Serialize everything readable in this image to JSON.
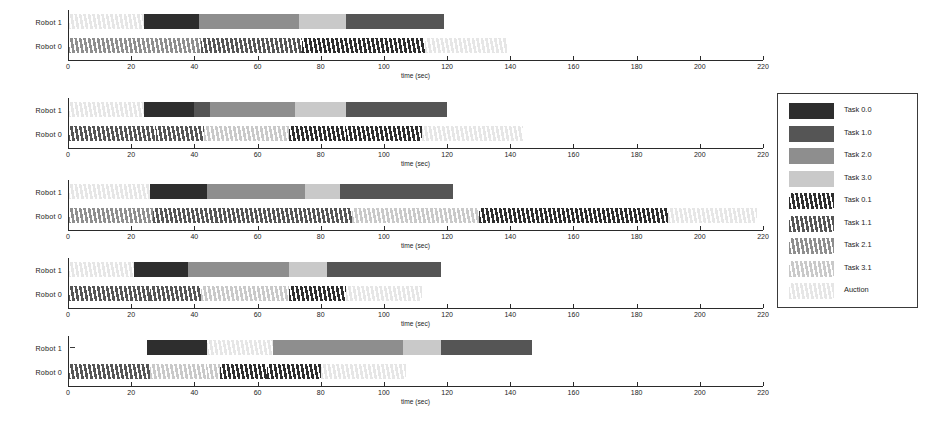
{
  "figure": {
    "axis_title": "time (sec)",
    "xlim": [
      0,
      220
    ],
    "xticks": [
      0,
      20,
      40,
      60,
      80,
      100,
      120,
      140,
      160,
      180,
      200,
      220
    ],
    "row_labels": [
      "Robot 1",
      "Robot 0"
    ]
  },
  "colors": {
    "task_0_0": "#2e2e2e",
    "task_1_0": "#555555",
    "task_2_0": "#8e8e8e",
    "task_3_0": "#c9c9c9",
    "task_0_1": "#2e2e2e",
    "task_1_1": "#555555",
    "task_2_1": "#8e8e8e",
    "task_3_1": "#c9c9c9",
    "auction": "#e6e6e6",
    "axis": "#2a2a2a",
    "text": "#232323",
    "background": "#ffffff"
  },
  "legend": {
    "items": [
      {
        "label": "Task 0.0",
        "key": "task_0_0",
        "hatched": false
      },
      {
        "label": "Task 1.0",
        "key": "task_1_0",
        "hatched": false
      },
      {
        "label": "Task 2.0",
        "key": "task_2_0",
        "hatched": false
      },
      {
        "label": "Task 3.0",
        "key": "task_3_0",
        "hatched": false
      },
      {
        "label": "Task 0.1",
        "key": "task_0_1",
        "hatched": true
      },
      {
        "label": "Task 1.1",
        "key": "task_1_1",
        "hatched": true
      },
      {
        "label": "Task 2.1",
        "key": "task_2_1",
        "hatched": true
      },
      {
        "label": "Task 3.1",
        "key": "task_3_1",
        "hatched": true
      },
      {
        "label": "Auction",
        "key": "auction",
        "hatched": true
      }
    ]
  },
  "chart_data": {
    "type": "bar",
    "title": "",
    "xlabel": "time (sec)",
    "ylabel": "",
    "xlim": [
      0,
      220
    ],
    "grid": false,
    "legend_position": "right",
    "subplots": [
      {
        "index": 1,
        "rows": [
          {
            "name": "Robot 1",
            "segments": [
              {
                "task": "Auction",
                "start": 0,
                "end": 24
              },
              {
                "task": "Task 0.0",
                "start": 24,
                "end": 41.5
              },
              {
                "task": "Task 2.0",
                "start": 41.5,
                "end": 73
              },
              {
                "task": "Task 3.0",
                "start": 73,
                "end": 88
              },
              {
                "task": "Task 1.0",
                "start": 88,
                "end": 113
              },
              {
                "task": "Task 1.0",
                "start": 113,
                "end": 119
              }
            ]
          },
          {
            "name": "Robot 0",
            "segments": [
              {
                "task": "Task 2.1",
                "start": 0,
                "end": 42
              },
              {
                "task": "Task 1.1",
                "start": 42,
                "end": 74
              },
              {
                "task": "Task 0.1",
                "start": 74,
                "end": 113
              },
              {
                "task": "Auction",
                "start": 113,
                "end": 139
              }
            ]
          }
        ]
      },
      {
        "index": 2,
        "rows": [
          {
            "name": "Robot 1",
            "segments": [
              {
                "task": "Auction",
                "start": 0,
                "end": 24
              },
              {
                "task": "Task 0.0",
                "start": 24,
                "end": 40
              },
              {
                "task": "Task 1.0",
                "start": 40,
                "end": 45
              },
              {
                "task": "Task 2.0",
                "start": 45,
                "end": 72
              },
              {
                "task": "Task 3.0",
                "start": 72,
                "end": 88
              },
              {
                "task": "Task 1.0",
                "start": 88,
                "end": 111
              },
              {
                "task": "Task 1.0",
                "start": 111,
                "end": 120
              }
            ]
          },
          {
            "name": "Robot 0",
            "segments": [
              {
                "task": "Task 1.1",
                "start": 0,
                "end": 28
              },
              {
                "task": "Task 1.1",
                "start": 28,
                "end": 43
              },
              {
                "task": "Task 3.1",
                "start": 43,
                "end": 70
              },
              {
                "task": "Task 0.1",
                "start": 70,
                "end": 88
              },
              {
                "task": "Task 0.1",
                "start": 88,
                "end": 112
              },
              {
                "task": "Auction",
                "start": 112,
                "end": 144
              }
            ]
          }
        ]
      },
      {
        "index": 3,
        "rows": [
          {
            "name": "Robot 1",
            "segments": [
              {
                "task": "Auction",
                "start": 0,
                "end": 26
              },
              {
                "task": "Task 0.0",
                "start": 26,
                "end": 44
              },
              {
                "task": "Task 2.0",
                "start": 44,
                "end": 75
              },
              {
                "task": "Task 3.0",
                "start": 75,
                "end": 86
              },
              {
                "task": "Task 1.0",
                "start": 86,
                "end": 122
              }
            ]
          },
          {
            "name": "Robot 0",
            "segments": [
              {
                "task": "Task 2.1",
                "start": 0,
                "end": 27
              },
              {
                "task": "Task 1.1",
                "start": 27,
                "end": 47
              },
              {
                "task": "Task 1.1",
                "start": 47,
                "end": 90
              },
              {
                "task": "Task 3.1",
                "start": 90,
                "end": 130
              },
              {
                "task": "Task 0.1",
                "start": 130,
                "end": 190
              },
              {
                "task": "Auction",
                "start": 190,
                "end": 218
              }
            ]
          }
        ]
      },
      {
        "index": 4,
        "rows": [
          {
            "name": "Robot 1",
            "segments": [
              {
                "task": "Auction",
                "start": 0,
                "end": 21
              },
              {
                "task": "Task 0.0",
                "start": 21,
                "end": 38
              },
              {
                "task": "Task 2.0",
                "start": 38,
                "end": 70
              },
              {
                "task": "Task 3.0",
                "start": 70,
                "end": 82
              },
              {
                "task": "Task 1.0",
                "start": 82,
                "end": 88
              },
              {
                "task": "Task 1.0",
                "start": 88,
                "end": 118
              }
            ]
          },
          {
            "name": "Robot 0",
            "segments": [
              {
                "task": "Task 1.1",
                "start": 0,
                "end": 26
              },
              {
                "task": "Task 1.1",
                "start": 26,
                "end": 42
              },
              {
                "task": "Task 3.1",
                "start": 42,
                "end": 70
              },
              {
                "task": "Task 0.1",
                "start": 70,
                "end": 88
              },
              {
                "task": "Auction",
                "start": 88,
                "end": 112
              }
            ]
          }
        ]
      },
      {
        "index": 5,
        "rows": [
          {
            "name": "Robot 1",
            "segments": [
              {
                "task": "Task 0.0",
                "start": 25,
                "end": 44
              },
              {
                "task": "Auction",
                "start": 44,
                "end": 65
              },
              {
                "task": "Task 2.0",
                "start": 65,
                "end": 106
              },
              {
                "task": "Task 3.0",
                "start": 106,
                "end": 118
              },
              {
                "task": "Task 1.0",
                "start": 118,
                "end": 147
              }
            ]
          },
          {
            "name": "Robot 0",
            "segments": [
              {
                "task": "Task 1.1",
                "start": 0,
                "end": 26
              },
              {
                "task": "Task 3.1",
                "start": 26,
                "end": 44
              },
              {
                "task": "Task 3.1",
                "start": 44,
                "end": 48
              },
              {
                "task": "Task 0.1",
                "start": 48,
                "end": 63
              },
              {
                "task": "Task 0.1",
                "start": 63,
                "end": 80
              },
              {
                "task": "Auction",
                "start": 80,
                "end": 107
              }
            ]
          }
        ]
      }
    ]
  }
}
